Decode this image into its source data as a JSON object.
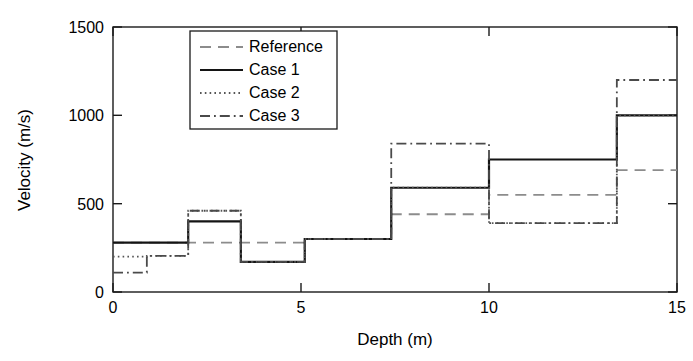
{
  "chart_data": {
    "type": "line",
    "subtype": "step-post",
    "title": "",
    "xlabel": "Depth (m)",
    "ylabel": "Velocity (m/s)",
    "xlim": [
      0,
      15
    ],
    "ylim": [
      0,
      1500
    ],
    "xticks": [
      0,
      5,
      10,
      15
    ],
    "yticks": [
      0,
      500,
      1000,
      1500
    ],
    "xtick_labels": [
      "0",
      "5",
      "10",
      "15"
    ],
    "ytick_labels": [
      "0",
      "500",
      "1000",
      "1500"
    ],
    "grid": false,
    "legend_position": "upper left",
    "series": [
      {
        "name": "Reference",
        "style": "dashed",
        "color": "#8c8c8c",
        "width": 1.8,
        "x": [
          0,
          5.1,
          7.4,
          10.0,
          13.4,
          15.0
        ],
        "y": [
          280,
          300,
          440,
          550,
          690,
          690
        ],
        "breakpoints": [
          0,
          5.1,
          7.4,
          10.0,
          13.4,
          15.0
        ],
        "levels": [
          280,
          300,
          440,
          550,
          690
        ]
      },
      {
        "name": "Case 1",
        "style": "solid",
        "color": "#141414",
        "width": 2.2,
        "x": [
          0,
          2.0,
          3.4,
          5.1,
          7.4,
          10.0,
          13.4,
          15.0
        ],
        "y": [
          280,
          400,
          170,
          300,
          590,
          750,
          1000,
          1000
        ],
        "breakpoints": [
          0,
          2.0,
          3.4,
          5.1,
          7.4,
          10.0,
          13.4,
          15.0
        ],
        "levels": [
          280,
          400,
          170,
          300,
          590,
          750,
          1000
        ]
      },
      {
        "name": "Case 2",
        "style": "dotted",
        "color": "#555555",
        "width": 1.8,
        "x": [
          0,
          0.9,
          2.0,
          3.4,
          5.1,
          7.4,
          10.0,
          13.4,
          15.0
        ],
        "y": [
          200,
          205,
          460,
          170,
          300,
          590,
          390,
          1000,
          1000
        ],
        "breakpoints": [
          0,
          0.9,
          2.0,
          3.4,
          5.1,
          7.4,
          10.0,
          13.4,
          15.0
        ],
        "levels": [
          200,
          205,
          460,
          170,
          300,
          590,
          390,
          1000
        ]
      },
      {
        "name": "Case 3",
        "style": "dashdot",
        "color": "#4a4a4a",
        "width": 1.8,
        "x": [
          0,
          0.9,
          2.0,
          3.4,
          5.1,
          7.4,
          10.0,
          13.4,
          15.0
        ],
        "y": [
          110,
          205,
          460,
          170,
          300,
          840,
          390,
          1200,
          1200
        ],
        "breakpoints": [
          0,
          0.9,
          2.0,
          3.4,
          5.1,
          7.4,
          10.0,
          13.4,
          15.0
        ],
        "levels": [
          110,
          205,
          460,
          170,
          300,
          840,
          390,
          1200
        ]
      }
    ],
    "legend": [
      {
        "label": "Reference",
        "style": "dashed",
        "color": "#8c8c8c"
      },
      {
        "label": "Case 1",
        "style": "solid",
        "color": "#141414"
      },
      {
        "label": "Case 2",
        "style": "dotted",
        "color": "#555555"
      },
      {
        "label": "Case 3",
        "style": "dashdot",
        "color": "#4a4a4a"
      }
    ]
  },
  "axes": {
    "x_label": "Depth (m)",
    "y_label": "Velocity (m/s)"
  }
}
